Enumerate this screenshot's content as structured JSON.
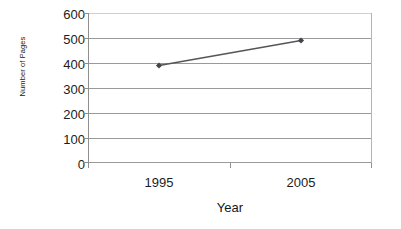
{
  "chart_data": {
    "type": "line",
    "title": "",
    "subtitle": "",
    "xlabel": "Year",
    "ylabel": "Number of Pages",
    "categories": [
      "1995",
      "2005"
    ],
    "values": [
      390,
      490
    ],
    "series": [
      {
        "name": "Number of Pages",
        "values": [
          390,
          490
        ]
      }
    ],
    "ylim": [
      0,
      600
    ],
    "y_ticks": [
      600,
      500,
      400,
      300,
      200,
      100,
      0
    ],
    "y_tick_labels": [
      "600",
      "500",
      "400",
      "300",
      "200",
      "100",
      "0"
    ],
    "x_tick_labels": [
      "1995",
      "2005"
    ],
    "grid": true,
    "grid_axis": "y",
    "legend": false,
    "legend_position": "none",
    "marker": "diamond",
    "annotations": []
  },
  "style": {
    "background_color": "#ffffff",
    "gridline_color": "#9a9a9a",
    "top_gridline_color": "#cfcfcf",
    "axis_color": "#8f8f8f",
    "right_border_color": "#b4b4b4",
    "series_line_color": "#55555a",
    "marker_color": "#44444a",
    "text_color": "#1c1c1c"
  }
}
